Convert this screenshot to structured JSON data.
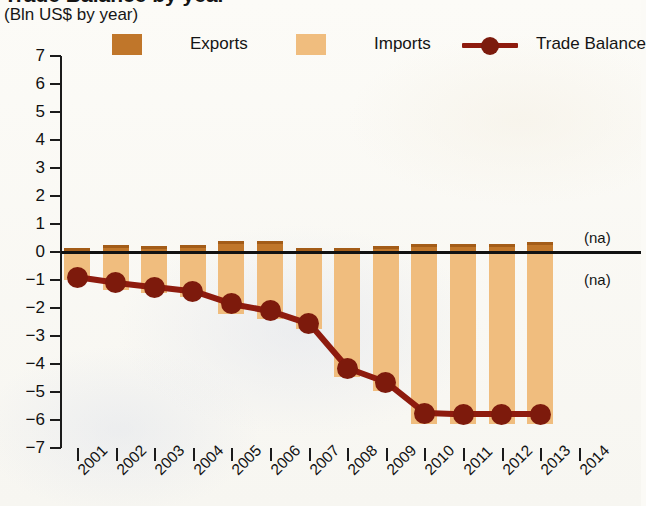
{
  "chart_data": {
    "type": "bar",
    "title": "Trade Balance by year",
    "subtitle": "(Bln US$ by year)",
    "xlabel": "",
    "ylabel": "",
    "ylim": [
      -7,
      7
    ],
    "yticks": [
      7,
      6,
      5,
      4,
      3,
      2,
      1,
      0,
      -1,
      -2,
      -3,
      -4,
      -5,
      -6,
      -7
    ],
    "ytick_labels": [
      "7",
      "6",
      "5",
      "4",
      "3",
      "2",
      "1",
      "0",
      "−1",
      "−2",
      "−3",
      "−4",
      "−5",
      "−6",
      "−7"
    ],
    "grid": false,
    "legend_position": "top",
    "categories": [
      "2001",
      "2002",
      "2003",
      "2004",
      "2005",
      "2006",
      "2007",
      "2008",
      "2009",
      "2010",
      "2011",
      "2012",
      "2013",
      "2014"
    ],
    "series": [
      {
        "name": "Exports",
        "kind": "bar",
        "color": "#C0762A",
        "values": [
          0.1,
          0.25,
          0.2,
          0.25,
          0.4,
          0.4,
          0.15,
          0.15,
          0.2,
          0.3,
          0.3,
          0.3,
          0.35,
          null
        ]
      },
      {
        "name": "Imports",
        "kind": "bar",
        "color": "#F0BD7E",
        "values": [
          -1.0,
          -1.35,
          -1.45,
          -1.6,
          -2.2,
          -2.4,
          -2.75,
          -4.45,
          -4.95,
          -6.15,
          -6.15,
          -6.15,
          -6.15,
          null
        ]
      },
      {
        "name": "Trade Balance",
        "kind": "line",
        "color": "#8E1B0E",
        "marker": "circle",
        "values": [
          -0.9,
          -1.1,
          -1.25,
          -1.4,
          -1.85,
          -2.1,
          -2.55,
          -4.15,
          -4.65,
          -5.75,
          -5.8,
          -5.8,
          -5.8,
          null
        ]
      }
    ],
    "annotations": [
      {
        "text": "(na)",
        "x": "2014",
        "y": 0.5
      },
      {
        "text": "(na)",
        "x": "2014",
        "y": -1.0
      }
    ]
  },
  "legend": {
    "items": [
      {
        "label": "Exports",
        "swatch": "#C0762A"
      },
      {
        "label": "Imports",
        "swatch": "#F0BD7E"
      },
      {
        "label": "Trade Balance",
        "swatch": "#8E1B0E"
      }
    ]
  }
}
